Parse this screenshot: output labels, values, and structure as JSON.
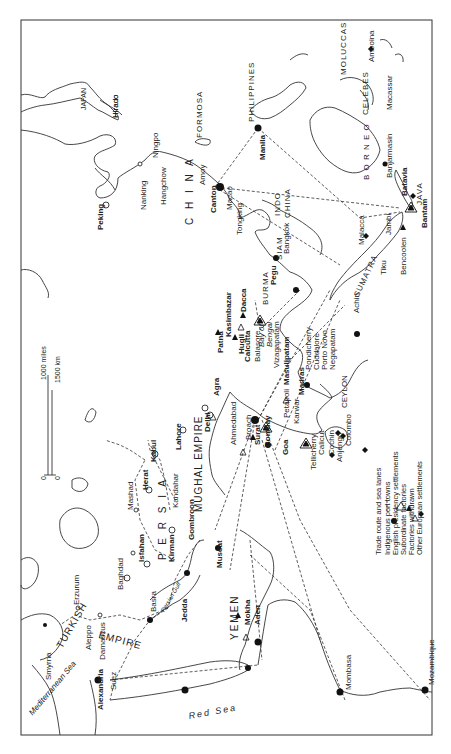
{
  "map": {
    "orientation": "rotated 90° clockwise (north points left)",
    "colors": {
      "ink": "#222222",
      "background": "#ffffff"
    },
    "scale": {
      "miles_label": "1000 miles",
      "km_label": "1500 km",
      "zero_a": "0",
      "zero_b": "0"
    },
    "regions": [
      {
        "id": "japan",
        "label": "JAPAN"
      },
      {
        "id": "formosa",
        "label": "FORMOSA"
      },
      {
        "id": "china",
        "label": "C H I N A"
      },
      {
        "id": "philippines",
        "label": "PHILIPPINES"
      },
      {
        "id": "moluccas",
        "label": "MOLUCCAS"
      },
      {
        "id": "celebes",
        "label": "CELEBES"
      },
      {
        "id": "borneo",
        "label": "B O R N E O"
      },
      {
        "id": "java",
        "label": "JAVA"
      },
      {
        "id": "sumatra",
        "label": "SUMATRA"
      },
      {
        "id": "indo",
        "label": "INDO"
      },
      {
        "id": "indochina",
        "label": "CHINA"
      },
      {
        "id": "siam",
        "label": "SIAM"
      },
      {
        "id": "burma",
        "label": "BURMA"
      },
      {
        "id": "ceylon",
        "label": "CEYLON"
      },
      {
        "id": "mughal",
        "label": "MUGHAL EMPIRE"
      },
      {
        "id": "persia",
        "label": "P E R S I A"
      },
      {
        "id": "turkish",
        "label": "TURKISH"
      },
      {
        "id": "empire",
        "label": "EMPIRE"
      },
      {
        "id": "yemen",
        "label": "YEMEN"
      }
    ],
    "seas": [
      {
        "id": "bay_of_bengal_1",
        "label": "Bay of"
      },
      {
        "id": "bay_of_bengal_2",
        "label": "Bengal"
      },
      {
        "id": "persian_gulf",
        "label": "Persian Gulf"
      },
      {
        "id": "red_sea",
        "label": "Red Sea"
      },
      {
        "id": "mediterranean",
        "label": "Mediterranean Sea"
      }
    ],
    "places": [
      {
        "name": "Hirado",
        "type": "european"
      },
      {
        "name": "Ningpo",
        "type": "indigenous"
      },
      {
        "name": "Hangchow",
        "type": "indigenous"
      },
      {
        "name": "Nanking",
        "type": "inland"
      },
      {
        "name": "Peking",
        "type": "capital"
      },
      {
        "name": "Amoy",
        "type": "indigenous"
      },
      {
        "name": "Canton",
        "type": "indigenous"
      },
      {
        "name": "Macao",
        "type": "european"
      },
      {
        "name": "Manila",
        "type": "indigenous"
      },
      {
        "name": "Amboina",
        "type": "european"
      },
      {
        "name": "Macassar",
        "type": "european"
      },
      {
        "name": "Banjarmasin",
        "type": "indigenous"
      },
      {
        "name": "Batavia",
        "type": "european"
      },
      {
        "name": "Bantam",
        "type": "presidency"
      },
      {
        "name": "Bencoolen",
        "type": "subordinate"
      },
      {
        "name": "Jambi",
        "type": "subordinate"
      },
      {
        "name": "Tiku",
        "type": "subordinate"
      },
      {
        "name": "Malacca",
        "type": "european"
      },
      {
        "name": "Achin",
        "type": "indigenous"
      },
      {
        "name": "Tongking",
        "type": "indigenous"
      },
      {
        "name": "Bangkok",
        "type": "indigenous"
      },
      {
        "name": "Pegu",
        "type": "indigenous"
      },
      {
        "name": "Dacca",
        "type": "subordinate"
      },
      {
        "name": "Kasimbazar",
        "type": "subordinate"
      },
      {
        "name": "Patna",
        "type": "subordinate"
      },
      {
        "name": "Hugli",
        "type": "withdrawn"
      },
      {
        "name": "Calcutta",
        "type": "presidency"
      },
      {
        "name": "Balasore",
        "type": "subordinate"
      },
      {
        "name": "Vizagapatam",
        "type": "subordinate"
      },
      {
        "name": "Masulipatam",
        "type": "indigenous"
      },
      {
        "name": "Madras",
        "type": "presidency"
      },
      {
        "name": "Pondicherry",
        "type": "european"
      },
      {
        "name": "Cuddalore",
        "type": "subordinate"
      },
      {
        "name": "Porto Novo",
        "type": "european"
      },
      {
        "name": "Negapatam",
        "type": "european"
      },
      {
        "name": "Colombo",
        "type": "european"
      },
      {
        "name": "Petapoli",
        "type": "withdrawn"
      },
      {
        "name": "Karwar",
        "type": "subordinate"
      },
      {
        "name": "Goa",
        "type": "indigenous"
      },
      {
        "name": "Tellicherry",
        "type": "subordinate"
      },
      {
        "name": "Calicut",
        "type": "subordinate"
      },
      {
        "name": "Cochin",
        "type": "european"
      },
      {
        "name": "Anjengo",
        "type": "subordinate"
      },
      {
        "name": "Agra",
        "type": "inland"
      },
      {
        "name": "Delhi",
        "type": "capital"
      },
      {
        "name": "Ahmedabad",
        "type": "withdrawn"
      },
      {
        "name": "Broach",
        "type": "withdrawn"
      },
      {
        "name": "Surat",
        "type": "indigenous"
      },
      {
        "name": "Bombay",
        "type": "presidency"
      },
      {
        "name": "Lahore",
        "type": "capital"
      },
      {
        "name": "Kabul",
        "type": "capital"
      },
      {
        "name": "Kandahar",
        "type": "inland"
      },
      {
        "name": "Herat",
        "type": "capital"
      },
      {
        "name": "Mashad",
        "type": "inland"
      },
      {
        "name": "Isfahan",
        "type": "capital"
      },
      {
        "name": "Kirman",
        "type": "capital"
      },
      {
        "name": "Gombroon",
        "type": "indigenous"
      },
      {
        "name": "Muscat",
        "type": "indigenous"
      },
      {
        "name": "Basra",
        "type": "indigenous"
      },
      {
        "name": "Baghdad",
        "type": "inland"
      },
      {
        "name": "Erzurum",
        "type": "inland"
      },
      {
        "name": "Aleppo",
        "type": "inland"
      },
      {
        "name": "Damascus",
        "type": "inland"
      },
      {
        "name": "Smyrna",
        "type": "indigenous"
      },
      {
        "name": "Suez",
        "type": "indigenous"
      },
      {
        "name": "Alexandria",
        "type": "indigenous"
      },
      {
        "name": "Jedda",
        "type": "indigenous"
      },
      {
        "name": "Mokha",
        "type": "withdrawn"
      },
      {
        "name": "Aden",
        "type": "indigenous"
      },
      {
        "name": "Mombasa",
        "type": "indigenous"
      },
      {
        "name": "Mozambique",
        "type": "indigenous"
      }
    ],
    "legend": [
      {
        "symbol": "- - - -",
        "label": "Trade route and sea lanes"
      },
      {
        "symbol": "●",
        "label": "Indigenous port towns"
      },
      {
        "symbol": "⚠",
        "label": "English presidency settlements"
      },
      {
        "symbol": "▲",
        "label": "Subordinate factories"
      },
      {
        "symbol": "△",
        "label": "Factories withdrawn"
      },
      {
        "symbol": "◆",
        "label": "Other European settlements"
      }
    ]
  }
}
